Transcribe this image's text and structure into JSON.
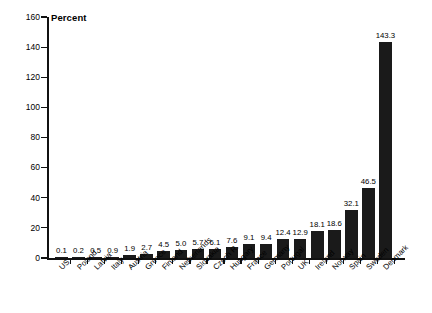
{
  "chart_data": {
    "type": "bar",
    "title": "",
    "ylabel": "Percent",
    "xlabel": "",
    "ylim": [
      0,
      160
    ],
    "ytick_step": 20,
    "yticks": [
      0,
      20,
      40,
      60,
      80,
      100,
      120,
      140,
      160
    ],
    "grid": false,
    "legend": null,
    "bar_color": "#1a1a1a",
    "categories": [
      "US",
      "Poland",
      "Latvia",
      "Italy",
      "Austria",
      "Greece",
      "Finland",
      "Netherlands",
      "Slovakia",
      "Czech R.",
      "Hungary",
      "France",
      "Germany",
      "Portugal",
      "UK",
      "Ireland",
      "Norway",
      "Spain",
      "Sweden",
      "Denmark"
    ],
    "values": [
      0.1,
      0.2,
      0.5,
      0.9,
      1.9,
      2.7,
      4.5,
      5.0,
      5.7,
      6.1,
      7.6,
      9.1,
      9.4,
      12.4,
      12.9,
      18.1,
      18.6,
      32.1,
      46.5,
      143.3
    ],
    "value_labels": [
      "0.1",
      "0.2",
      "0.5",
      "0.9",
      "1.9",
      "2.7",
      "4.5",
      "5.0",
      "5.7",
      "6.1",
      "7.6",
      "9.1",
      "9.4",
      "12.4",
      "12.9",
      "18.1",
      "18.6",
      "32.1",
      "46.5",
      "143.3"
    ]
  }
}
